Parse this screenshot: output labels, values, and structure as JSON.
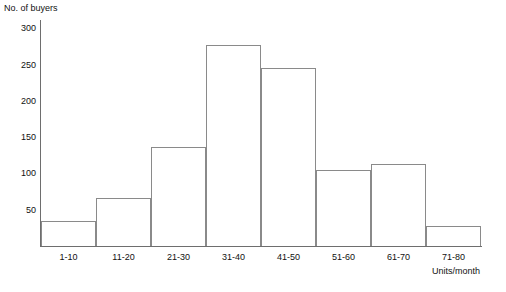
{
  "chart_data": {
    "type": "bar",
    "title": "",
    "subtitle": "",
    "categories": [
      "1-10",
      "11-20",
      "21-30",
      "31-40",
      "41-50",
      "51-60",
      "61-70",
      "71-80"
    ],
    "values": [
      35,
      66,
      137,
      277,
      245,
      105,
      113,
      28
    ],
    "xlabel": "Units/month",
    "ylabel": "No. of buyers",
    "ylim": [
      0,
      300
    ],
    "yticks": [
      50,
      100,
      150,
      200,
      250,
      300
    ],
    "ytick_labels": [
      "50",
      "100",
      "150",
      "200",
      "250",
      "300"
    ],
    "grid": false,
    "legend": null,
    "bar_fill_color": "#ffffff",
    "bar_edge_color": "#8a8a8a",
    "axis_color": "#6e6e6e",
    "text_color": "#111111",
    "background_color": "#ffffff"
  }
}
